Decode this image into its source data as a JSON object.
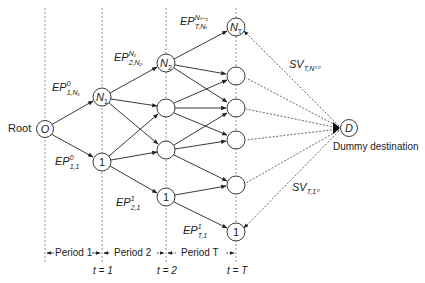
{
  "diagram": {
    "root_label": "Root",
    "destination_label": "Dummy destination",
    "nodes": {
      "root": "O",
      "n1": "N",
      "n1_sub": "1",
      "one_t1": "1",
      "n2": "N",
      "n2_sub": "2",
      "one_t2": "1",
      "nT": "N",
      "nT_sub": "T",
      "one_tT": "1",
      "dest": "D"
    },
    "edge_labels": {
      "ep_1_N1": {
        "base": "EP",
        "sup": "0",
        "sub": "1,N₁"
      },
      "ep_1_1": {
        "base": "EP",
        "sup": "0",
        "sub": "1,1"
      },
      "ep_2_N2": {
        "base": "EP",
        "sup": "N₁",
        "sub": "2,N₂"
      },
      "ep_2_1": {
        "base": "EP",
        "sup": "1",
        "sub": "2,1"
      },
      "ep_T_NT": {
        "base": "EP",
        "sup": "Nₜ₋₁",
        "sub": "T,Nₜ"
      },
      "ep_T_1": {
        "base": "EP",
        "sup": "1",
        "sub": "T,1"
      },
      "sv_T_NT": {
        "base": "SV",
        "sub": "T,Nᵀ⁰"
      },
      "sv_T_1": {
        "base": "SV",
        "sub": "T,1⁰"
      }
    },
    "periods": [
      {
        "label": "Period 1"
      },
      {
        "label": "Period 2"
      },
      {
        "label": "Period T"
      }
    ],
    "time_marks": [
      {
        "label": "t = 1"
      },
      {
        "label": "t = 2"
      },
      {
        "label": "t = T"
      }
    ],
    "colors": {
      "line": "#222222",
      "dashed": "#555555",
      "background": "#ffffff"
    }
  }
}
